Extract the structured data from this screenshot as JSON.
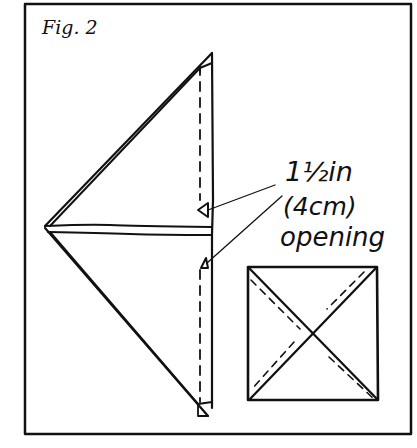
{
  "figure": {
    "title": "Fig. 2",
    "annotation": {
      "line1": "1½in",
      "line2": "(4cm)",
      "line3": "opening"
    },
    "parts": [
      {
        "name": "folded-triangle",
        "description": "Large triangle folded in half with seam allowance and dashed stitching line along right edge"
      },
      {
        "name": "center-fold",
        "description": "Horizontal double line across middle of triangle"
      },
      {
        "name": "opening-markers",
        "description": "Two small triangular arrows marking the opening on the stitching line"
      },
      {
        "name": "square-detail",
        "description": "Square with two diagonals and dashed stitching lines parallel to one side of each diagonal"
      }
    ],
    "ink_color": "#111111",
    "background_color": "#ffffff"
  }
}
